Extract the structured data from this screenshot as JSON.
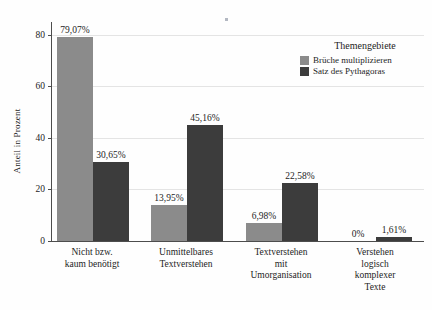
{
  "chart_data": {
    "type": "bar",
    "title": "",
    "xlabel": "",
    "ylabel": "Anteil in Prozent",
    "ylim": [
      0,
      85
    ],
    "yticks": [
      0,
      20,
      40,
      60,
      80
    ],
    "ytick_labels": [
      "0",
      "20",
      "40",
      "60",
      "80"
    ],
    "grid": true,
    "legend_position": "top-right",
    "legend_title": "Themengebiete",
    "categories": [
      "Nicht bzw. kaum benötigt",
      "Unmittelbares Textverstehen",
      "Textverstehen mit Umorganisation",
      "Verstehen logisch komplexer Texte"
    ],
    "category_lines": [
      [
        "Nicht bzw.",
        "kaum benötigt"
      ],
      [
        "Unmittelbares",
        "Textverstehen"
      ],
      [
        "Textverstehen",
        "mit",
        "Umorganisation"
      ],
      [
        "Verstehen",
        "logisch",
        "komplexer",
        "Texte"
      ]
    ],
    "series": [
      {
        "name": "Brüche multiplizieren",
        "color": "#8b8b8b",
        "values": [
          79.07,
          13.95,
          6.98,
          0
        ],
        "labels": [
          "79,07%",
          "13,95%",
          "6,98%",
          "0%"
        ]
      },
      {
        "name": "Satz des Pythagoras",
        "color": "#3c3c3c",
        "values": [
          30.65,
          45.16,
          22.58,
          1.61
        ],
        "labels": [
          "30,65%",
          "45,16%",
          "22,58%",
          "1,61%"
        ]
      }
    ]
  },
  "axis": {
    "y_title": "Anteil in Prozent"
  },
  "legend": {
    "title": "Themengebiete",
    "items": [
      {
        "label": "Brüche multiplizieren",
        "color": "#8b8b8b"
      },
      {
        "label": "Satz des Pythagoras",
        "color": "#3c3c3c"
      }
    ]
  },
  "colors": {
    "series_light": "#8b8b8b",
    "series_dark": "#3c3c3c",
    "axis": "#4d4d4d",
    "grid": "#e4e4e4",
    "text": "#1d1d1d",
    "background": "#fefefe"
  }
}
